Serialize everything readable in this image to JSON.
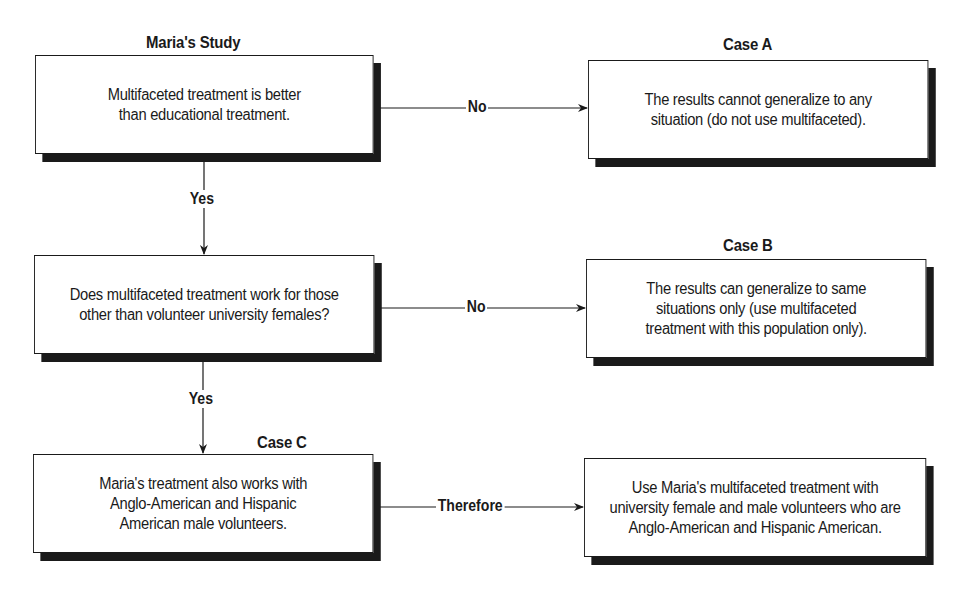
{
  "diagram": {
    "nodes": {
      "maria_study": {
        "heading": "Maria's Study",
        "text": "Multifaceted treatment is better\nthan educational treatment."
      },
      "question": {
        "heading": "",
        "text": "Does multifaceted treatment work for those\nother than volunteer university females?"
      },
      "case_c": {
        "heading": "Case C",
        "text": "Maria's treatment also works with\nAnglo-American and Hispanic\nAmerican male volunteers."
      },
      "case_a": {
        "heading": "Case A",
        "text": "The results cannot generalize to any\nsituation (do not use multifaceted)."
      },
      "case_b": {
        "heading": "Case B",
        "text": "The results can generalize to same\nsituations only (use multifaceted\ntreatment with this population only)."
      },
      "conclusion": {
        "heading": "",
        "text": "Use Maria's multifaceted treatment with\nuniversity female and male volunteers who are\nAnglo-American and Hispanic American."
      }
    },
    "edges": {
      "study_to_case_a": "No",
      "study_to_question": "Yes",
      "question_to_case_b": "No",
      "question_to_case_c": "Yes",
      "case_c_to_conclusion": "Therefore"
    },
    "colors": {
      "ink": "#1a1a1a",
      "background": "#ffffff"
    }
  }
}
